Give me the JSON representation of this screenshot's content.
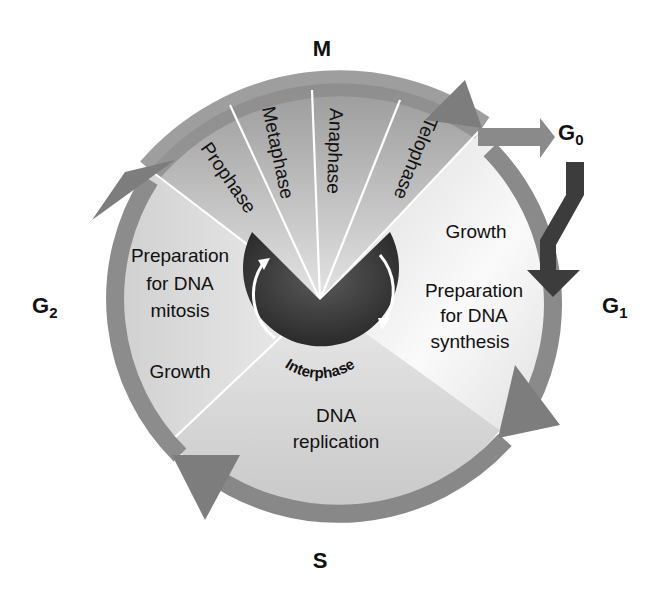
{
  "colors": {
    "ring": "#8a8a8a",
    "ring_dark": "#6e6e6e",
    "g0_arrow": "#3a3a3a",
    "fill_light": "#e6e6e6",
    "interphase_disc": "#444444",
    "text": "#111111",
    "background": "#ffffff"
  },
  "phase_labels": {
    "m": "M",
    "g0": "G",
    "g0_sub": "0",
    "g1": "G",
    "g1_sub": "1",
    "g2": "G",
    "g2_sub": "2",
    "s": "S"
  },
  "mitosis_stages": [
    "Prophase",
    "Metaphase",
    "Anaphase",
    "Telophase"
  ],
  "g1_sector": {
    "line1": "Growth",
    "line2": "Preparation",
    "line3": "for DNA",
    "line4": "synthesis"
  },
  "g2_sector": {
    "line1": "Preparation",
    "line2": "for DNA",
    "line3": "mitosis",
    "line4": "Growth"
  },
  "s_sector": {
    "line1": "DNA",
    "line2": "replication"
  },
  "center": {
    "label": "Interphase"
  }
}
